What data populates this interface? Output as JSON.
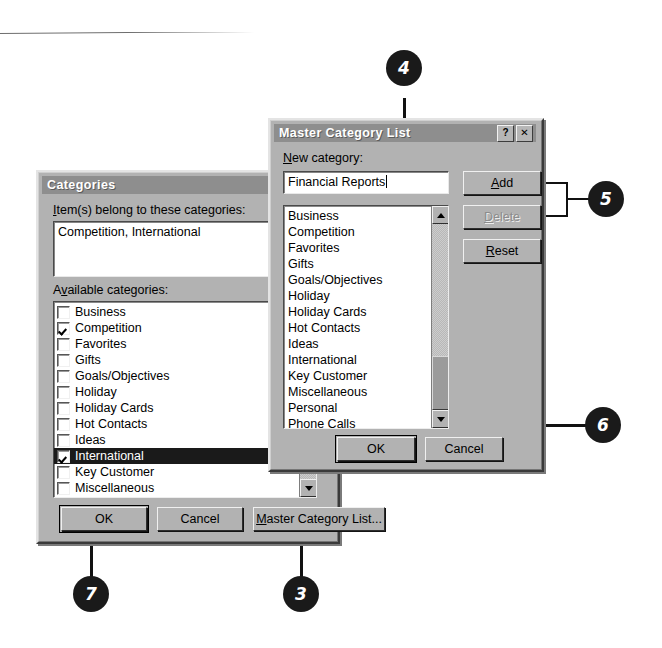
{
  "categories_dialog": {
    "title": "Categories",
    "items_label": "Item(s) belong to these categories:",
    "items_value": "Competition, International",
    "available_label": "Available categories:",
    "available": [
      {
        "label": "Business",
        "checked": false,
        "selected": false
      },
      {
        "label": "Competition",
        "checked": true,
        "selected": false
      },
      {
        "label": "Favorites",
        "checked": false,
        "selected": false
      },
      {
        "label": "Gifts",
        "checked": false,
        "selected": false
      },
      {
        "label": "Goals/Objectives",
        "checked": false,
        "selected": false
      },
      {
        "label": "Holiday",
        "checked": false,
        "selected": false
      },
      {
        "label": "Holiday Cards",
        "checked": false,
        "selected": false
      },
      {
        "label": "Hot Contacts",
        "checked": false,
        "selected": false
      },
      {
        "label": "Ideas",
        "checked": false,
        "selected": false
      },
      {
        "label": "International",
        "checked": true,
        "selected": true
      },
      {
        "label": "Key Customer",
        "checked": false,
        "selected": false
      },
      {
        "label": "Miscellaneous",
        "checked": false,
        "selected": false
      },
      {
        "label": "Personal",
        "checked": false,
        "selected": false
      },
      {
        "label": "Phone Calls",
        "checked": false,
        "selected": false
      }
    ],
    "ok_label": "OK",
    "cancel_label": "Cancel",
    "master_button_label": "Master Category List..."
  },
  "master_dialog": {
    "title": "Master Category List",
    "help_glyph": "?",
    "close_glyph": "✕",
    "new_category_label": "New category:",
    "new_category_value": "Financial Reports",
    "list": [
      "Business",
      "Competition",
      "Favorites",
      "Gifts",
      "Goals/Objectives",
      "Holiday",
      "Holiday Cards",
      "Hot Contacts",
      "Ideas",
      "International",
      "Key Customer",
      "Miscellaneous",
      "Personal",
      "Phone Calls",
      "Status",
      "Strategies"
    ],
    "add_label": "Add",
    "delete_label": "Delete",
    "delete_disabled": true,
    "reset_label": "Reset",
    "ok_label": "OK",
    "cancel_label": "Cancel"
  },
  "callouts": [
    {
      "number": "4",
      "target": "new-category-field"
    },
    {
      "number": "5",
      "target": "add-delete-buttons"
    },
    {
      "number": "6",
      "target": "master-ok-button"
    },
    {
      "number": "3",
      "target": "master-category-list-button"
    },
    {
      "number": "7",
      "target": "categories-ok-button"
    }
  ],
  "colors": {
    "dialog_face": "#b2b2b2",
    "titlebar": "#8e8e8e",
    "selection": "#1a1a1a",
    "field_bg": "#ffffff",
    "callout_bg": "#1a1a1a"
  }
}
